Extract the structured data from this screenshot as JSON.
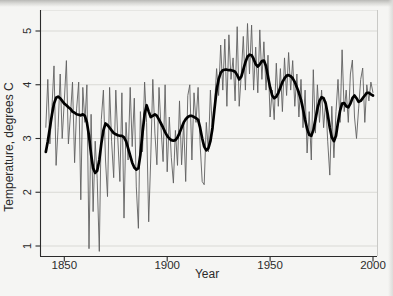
{
  "figure": {
    "y_axis_title": "Temperature, degrees C",
    "x_axis_title": "Year"
  },
  "chart_data": {
    "type": "line",
    "title": "",
    "xlabel": "Year",
    "ylabel": "Temperature, degrees C",
    "xlim": [
      1838,
      2002
    ],
    "ylim": [
      0.8,
      5.3
    ],
    "x_ticks": [
      1850,
      1900,
      1950,
      2000
    ],
    "y_ticks": [
      1,
      2,
      3,
      4,
      5
    ],
    "grid": "horizontal-light-gray",
    "legend": "none",
    "colors": {
      "annual_line": "#606060",
      "smoothed_line": "#000000",
      "gridline": "#d9d9d5",
      "frame": "#c9c9c6",
      "axis": "#2b2b2b",
      "background": "#f5f5f3"
    },
    "x": [
      1841,
      1842,
      1843,
      1844,
      1845,
      1846,
      1847,
      1848,
      1849,
      1850,
      1851,
      1852,
      1853,
      1854,
      1855,
      1856,
      1857,
      1858,
      1859,
      1860,
      1861,
      1862,
      1863,
      1864,
      1865,
      1866,
      1867,
      1868,
      1869,
      1870,
      1871,
      1872,
      1873,
      1874,
      1875,
      1876,
      1877,
      1878,
      1879,
      1880,
      1881,
      1882,
      1883,
      1884,
      1885,
      1886,
      1887,
      1888,
      1889,
      1890,
      1891,
      1892,
      1893,
      1894,
      1895,
      1896,
      1897,
      1898,
      1899,
      1900,
      1901,
      1902,
      1903,
      1904,
      1905,
      1906,
      1907,
      1908,
      1909,
      1910,
      1911,
      1912,
      1913,
      1914,
      1915,
      1916,
      1917,
      1918,
      1919,
      1920,
      1921,
      1922,
      1923,
      1924,
      1925,
      1926,
      1927,
      1928,
      1929,
      1930,
      1931,
      1932,
      1933,
      1934,
      1935,
      1936,
      1937,
      1938,
      1939,
      1940,
      1941,
      1942,
      1943,
      1944,
      1945,
      1946,
      1947,
      1948,
      1949,
      1950,
      1951,
      1952,
      1953,
      1954,
      1955,
      1956,
      1957,
      1958,
      1959,
      1960,
      1961,
      1962,
      1963,
      1964,
      1965,
      1966,
      1967,
      1968,
      1969,
      1970,
      1971,
      1972,
      1973,
      1974,
      1975,
      1976,
      1977,
      1978,
      1979,
      1980,
      1981,
      1982,
      1983,
      1984,
      1985,
      1986,
      1987,
      1988,
      1989,
      1990,
      1991,
      1992,
      1993,
      1994,
      1995,
      1996,
      1997,
      1998,
      1999,
      2000
    ],
    "series": [
      {
        "name": "annual temperature",
        "style": "thin",
        "values": [
          3.2,
          4.1,
          2.9,
          3.6,
          4.35,
          2.5,
          3.2,
          4.2,
          3.0,
          3.7,
          4.45,
          2.9,
          3.45,
          4.05,
          2.55,
          3.55,
          4.05,
          1.86,
          3.95,
          3.3,
          4.0,
          0.95,
          3.45,
          1.64,
          2.95,
          2.25,
          0.9,
          3.35,
          3.9,
          2.6,
          1.92,
          3.95,
          2.95,
          2.27,
          3.9,
          3.0,
          2.2,
          3.85,
          1.52,
          3.3,
          2.6,
          3.95,
          2.85,
          3.75,
          2.1,
          1.33,
          3.5,
          2.75,
          4.05,
          3.3,
          1.45,
          2.6,
          4.1,
          3.1,
          2.51,
          3.95,
          3.2,
          2.57,
          4.0,
          2.38,
          3.4,
          2.65,
          2.17,
          3.15,
          2.5,
          3.7,
          2.51,
          3.3,
          2.2,
          3.8,
          4.0,
          2.6,
          3.85,
          3.3,
          3.95,
          2.9,
          2.2,
          2.14,
          3.3,
          2.75,
          3.9,
          3.1,
          3.6,
          4.3,
          3.8,
          4.74,
          3.9,
          4.85,
          3.6,
          4.93,
          4.1,
          4.5,
          3.7,
          5.08,
          3.6,
          4.2,
          4.9,
          3.9,
          5.14,
          4.2,
          5.11,
          3.9,
          4.7,
          3.85,
          5.02,
          4.1,
          4.8,
          3.9,
          4.55,
          3.4,
          3.9,
          3.35,
          4.4,
          3.6,
          4.3,
          3.5,
          4.5,
          3.8,
          4.6,
          3.9,
          4.45,
          3.6,
          4.2,
          3.4,
          4.1,
          3.2,
          3.9,
          2.73,
          3.5,
          2.6,
          4.28,
          3.1,
          4.0,
          3.3,
          3.9,
          3.2,
          3.7,
          2.95,
          2.32,
          3.6,
          2.64,
          3.5,
          4.1,
          3.3,
          4.65,
          3.5,
          3.9,
          3.3,
          4.2,
          4.46,
          3.4,
          3.0,
          3.55,
          4.1,
          4.31,
          3.3,
          4.0,
          3.7,
          4.05,
          3.85
        ]
      },
      {
        "name": "smoothed temperature",
        "style": "thick",
        "values": [
          2.75,
          2.95,
          3.2,
          3.45,
          3.65,
          3.76,
          3.78,
          3.75,
          3.7,
          3.65,
          3.62,
          3.58,
          3.55,
          3.5,
          3.48,
          3.45,
          3.44,
          3.43,
          3.45,
          3.42,
          3.3,
          3.05,
          2.7,
          2.45,
          2.36,
          2.4,
          2.6,
          2.9,
          3.15,
          3.28,
          3.25,
          3.2,
          3.15,
          3.1,
          3.08,
          3.06,
          3.05,
          3.05,
          3.02,
          2.95,
          2.82,
          2.68,
          2.55,
          2.46,
          2.42,
          2.45,
          2.7,
          3.1,
          3.45,
          3.62,
          3.5,
          3.4,
          3.42,
          3.45,
          3.42,
          3.35,
          3.28,
          3.2,
          3.12,
          3.05,
          3.0,
          2.97,
          2.96,
          2.97,
          3.02,
          3.1,
          3.2,
          3.3,
          3.36,
          3.4,
          3.42,
          3.42,
          3.4,
          3.38,
          3.35,
          3.2,
          3.0,
          2.85,
          2.78,
          2.82,
          2.95,
          3.2,
          3.55,
          3.9,
          4.1,
          4.22,
          4.27,
          4.28,
          4.28,
          4.27,
          4.27,
          4.26,
          4.24,
          4.18,
          4.1,
          4.15,
          4.28,
          4.42,
          4.52,
          4.56,
          4.55,
          4.48,
          4.38,
          4.34,
          4.38,
          4.44,
          4.45,
          4.35,
          4.15,
          3.95,
          3.8,
          3.75,
          3.78,
          3.85,
          3.95,
          4.05,
          4.12,
          4.17,
          4.18,
          4.16,
          4.12,
          4.05,
          3.95,
          3.85,
          3.72,
          3.55,
          3.35,
          3.18,
          3.07,
          3.05,
          3.15,
          3.35,
          3.55,
          3.7,
          3.77,
          3.75,
          3.65,
          3.45,
          3.2,
          3.02,
          2.95,
          3.05,
          3.3,
          3.52,
          3.65,
          3.66,
          3.6,
          3.58,
          3.65,
          3.75,
          3.8,
          3.75,
          3.68,
          3.7,
          3.75,
          3.8,
          3.85,
          3.85,
          3.82,
          3.8
        ]
      }
    ]
  }
}
